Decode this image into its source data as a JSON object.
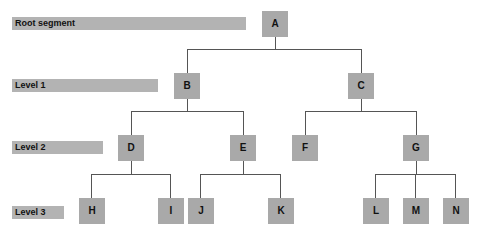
{
  "levels": [
    {
      "label": "Root segment"
    },
    {
      "label": "Level 1"
    },
    {
      "label": "Level 2"
    },
    {
      "label": "Level 3"
    }
  ],
  "nodes": {
    "A": "A",
    "B": "B",
    "C": "C",
    "D": "D",
    "E": "E",
    "F": "F",
    "G": "G",
    "H": "H",
    "I": "I",
    "J": "J",
    "K": "K",
    "L": "L",
    "M": "M",
    "N": "N"
  },
  "colors": {
    "node_fill": "#a9a9a9",
    "label_bar": "#b3b3b3",
    "connector": "#555555"
  }
}
